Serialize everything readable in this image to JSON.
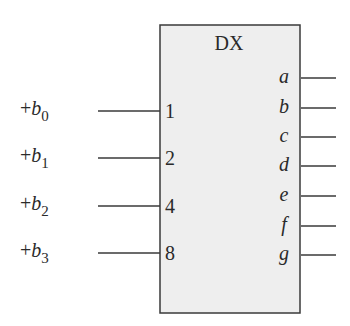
{
  "block": {
    "title": "DX",
    "fill": "#eeeeee",
    "stroke": "#3a3a3a"
  },
  "inputs": [
    {
      "signal": "+b",
      "subscript": "0",
      "pin": "1"
    },
    {
      "signal": "+b",
      "subscript": "1",
      "pin": "2"
    },
    {
      "signal": "+b",
      "subscript": "2",
      "pin": "4"
    },
    {
      "signal": "+b",
      "subscript": "3",
      "pin": "8"
    }
  ],
  "outputs": [
    {
      "pin": "a"
    },
    {
      "pin": "b"
    },
    {
      "pin": "c"
    },
    {
      "pin": "d"
    },
    {
      "pin": "e"
    },
    {
      "pin": "f"
    },
    {
      "pin": "g"
    }
  ]
}
